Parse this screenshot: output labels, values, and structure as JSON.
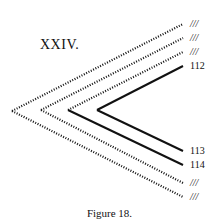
{
  "figure": {
    "title": "XXIV.",
    "caption": "Figure 18.",
    "labels": [
      {
        "text": "///",
        "y": 24,
        "italic": true
      },
      {
        "text": "///",
        "y": 38,
        "italic": true
      },
      {
        "text": "///",
        "y": 52,
        "italic": true
      },
      {
        "text": "112",
        "y": 66,
        "italic": false
      },
      {
        "text": "113",
        "y": 151,
        "italic": false
      },
      {
        "text": "114",
        "y": 165,
        "italic": false
      },
      {
        "text": "///",
        "y": 183,
        "italic": true
      },
      {
        "text": "///",
        "y": 197,
        "italic": true
      }
    ],
    "chevrons": [
      {
        "vertex": [
          12,
          111
        ],
        "top_end": [
          183,
          24
        ],
        "bottom_end": [
          183,
          197
        ],
        "top_style": "dotted",
        "bottom_style": "dotted"
      },
      {
        "vertex": [
          41,
          110
        ],
        "top_end": [
          183,
          38
        ],
        "bottom_end": [
          183,
          183
        ],
        "top_style": "dotted",
        "bottom_style": "dotted"
      },
      {
        "vertex": [
          68,
          110
        ],
        "top_end": [
          183,
          52
        ],
        "bottom_end": [
          183,
          165
        ],
        "top_style": "dotted",
        "bottom_style": "solid"
      },
      {
        "vertex": [
          97,
          110
        ],
        "top_end": [
          183,
          66
        ],
        "bottom_end": [
          183,
          151
        ],
        "top_style": "solid",
        "bottom_style": "solid"
      }
    ]
  }
}
